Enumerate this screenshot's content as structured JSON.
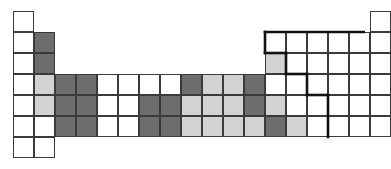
{
  "figure": {
    "kind": "periodic-table-grid",
    "columns": 18,
    "rows": 7,
    "cell_size_px": 21,
    "origin_x_px": 13,
    "origin_y_px": 11,
    "background_color": "#ffffff",
    "grid_line_color": "#3a3a3a",
    "grid_line_width_px": 1.4,
    "accent_border_color": "#111111",
    "accent_border_width_px": 2.6
  },
  "legend": {
    "fill_white": "#ffffff",
    "fill_light": "#d2d2d2",
    "fill_dark": "#6d6d6d"
  },
  "chart_data": {
    "type": "heatmap",
    "title": "",
    "xlabel": "",
    "ylabel": "",
    "categories": [
      "1",
      "2",
      "3",
      "4",
      "5",
      "6",
      "7",
      "8",
      "9",
      "10",
      "11",
      "12",
      "13",
      "14",
      "15",
      "16",
      "17",
      "18"
    ],
    "row_labels": [
      "1",
      "2",
      "3",
      "4",
      "5",
      "6",
      "7"
    ],
    "value_colors": {
      "white": "#ffffff",
      "light": "#d2d2d2",
      "dark": "#6d6d6d"
    },
    "rows": [
      {
        "row": 1,
        "cells": [
          {
            "col": 1,
            "fill": "white"
          },
          {
            "col": 18,
            "fill": "white"
          }
        ]
      },
      {
        "row": 2,
        "cells": [
          {
            "col": 1,
            "fill": "white"
          },
          {
            "col": 2,
            "fill": "dark"
          },
          {
            "col": 13,
            "fill": "white"
          },
          {
            "col": 14,
            "fill": "white"
          },
          {
            "col": 15,
            "fill": "white"
          },
          {
            "col": 16,
            "fill": "white"
          },
          {
            "col": 17,
            "fill": "white"
          },
          {
            "col": 18,
            "fill": "white"
          }
        ]
      },
      {
        "row": 3,
        "cells": [
          {
            "col": 1,
            "fill": "white"
          },
          {
            "col": 2,
            "fill": "dark"
          },
          {
            "col": 13,
            "fill": "light"
          },
          {
            "col": 14,
            "fill": "white"
          },
          {
            "col": 15,
            "fill": "white"
          },
          {
            "col": 16,
            "fill": "white"
          },
          {
            "col": 17,
            "fill": "white"
          },
          {
            "col": 18,
            "fill": "white"
          }
        ]
      },
      {
        "row": 4,
        "cells": [
          {
            "col": 1,
            "fill": "white"
          },
          {
            "col": 2,
            "fill": "light"
          },
          {
            "col": 3,
            "fill": "dark"
          },
          {
            "col": 4,
            "fill": "dark"
          },
          {
            "col": 5,
            "fill": "white"
          },
          {
            "col": 6,
            "fill": "white"
          },
          {
            "col": 7,
            "fill": "white"
          },
          {
            "col": 8,
            "fill": "white"
          },
          {
            "col": 9,
            "fill": "dark"
          },
          {
            "col": 10,
            "fill": "light"
          },
          {
            "col": 11,
            "fill": "light"
          },
          {
            "col": 12,
            "fill": "dark"
          },
          {
            "col": 13,
            "fill": "white"
          },
          {
            "col": 14,
            "fill": "white"
          },
          {
            "col": 15,
            "fill": "white"
          },
          {
            "col": 16,
            "fill": "white"
          },
          {
            "col": 17,
            "fill": "white"
          },
          {
            "col": 18,
            "fill": "white"
          }
        ]
      },
      {
        "row": 5,
        "cells": [
          {
            "col": 1,
            "fill": "white"
          },
          {
            "col": 2,
            "fill": "light"
          },
          {
            "col": 3,
            "fill": "dark"
          },
          {
            "col": 4,
            "fill": "dark"
          },
          {
            "col": 5,
            "fill": "white"
          },
          {
            "col": 6,
            "fill": "white"
          },
          {
            "col": 7,
            "fill": "dark"
          },
          {
            "col": 8,
            "fill": "dark"
          },
          {
            "col": 9,
            "fill": "light"
          },
          {
            "col": 10,
            "fill": "light"
          },
          {
            "col": 11,
            "fill": "light"
          },
          {
            "col": 12,
            "fill": "dark"
          },
          {
            "col": 13,
            "fill": "light"
          },
          {
            "col": 14,
            "fill": "white"
          },
          {
            "col": 15,
            "fill": "white"
          },
          {
            "col": 16,
            "fill": "white"
          },
          {
            "col": 17,
            "fill": "white"
          },
          {
            "col": 18,
            "fill": "white"
          }
        ]
      },
      {
        "row": 6,
        "cells": [
          {
            "col": 1,
            "fill": "white"
          },
          {
            "col": 2,
            "fill": "white"
          },
          {
            "col": 3,
            "fill": "dark"
          },
          {
            "col": 4,
            "fill": "dark"
          },
          {
            "col": 5,
            "fill": "white"
          },
          {
            "col": 6,
            "fill": "white"
          },
          {
            "col": 7,
            "fill": "dark"
          },
          {
            "col": 8,
            "fill": "dark"
          },
          {
            "col": 9,
            "fill": "light"
          },
          {
            "col": 10,
            "fill": "light"
          },
          {
            "col": 11,
            "fill": "light"
          },
          {
            "col": 12,
            "fill": "light"
          },
          {
            "col": 13,
            "fill": "dark"
          },
          {
            "col": 14,
            "fill": "light"
          },
          {
            "col": 15,
            "fill": "white"
          },
          {
            "col": 16,
            "fill": "white"
          },
          {
            "col": 17,
            "fill": "white"
          },
          {
            "col": 18,
            "fill": "white"
          }
        ]
      },
      {
        "row": 7,
        "cells": [
          {
            "col": 1,
            "fill": "white"
          },
          {
            "col": 2,
            "fill": "white"
          }
        ]
      }
    ],
    "accent_outline": {
      "description": "metalloid-staircase",
      "segments": [
        {
          "from_col": 13,
          "from_row": 2,
          "to_col": 19,
          "to_row": 2,
          "orientation": "h"
        },
        {
          "from_col": 13,
          "from_row": 2,
          "to_col": 13,
          "to_row": 3,
          "orientation": "v"
        },
        {
          "from_col": 13,
          "from_row": 3,
          "to_col": 14,
          "to_row": 3,
          "orientation": "h"
        },
        {
          "from_col": 14,
          "from_row": 3,
          "to_col": 14,
          "to_row": 4,
          "orientation": "v"
        },
        {
          "from_col": 14,
          "from_row": 4,
          "to_col": 15,
          "to_row": 4,
          "orientation": "h"
        },
        {
          "from_col": 15,
          "from_row": 4,
          "to_col": 15,
          "to_row": 5,
          "orientation": "v"
        },
        {
          "from_col": 15,
          "from_row": 5,
          "to_col": 16,
          "to_row": 5,
          "orientation": "h"
        },
        {
          "from_col": 16,
          "from_row": 5,
          "to_col": 16,
          "to_row": 7,
          "orientation": "v"
        },
        {
          "from_col": 18,
          "from_row": 1,
          "to_col": 19,
          "to_row": 1,
          "orientation": "h"
        }
      ]
    }
  }
}
